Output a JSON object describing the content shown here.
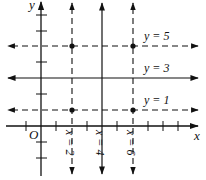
{
  "diagram": {
    "type": "coordinate-plane-lines",
    "axes": {
      "x_label": "x",
      "y_label": "y",
      "origin_label": "O"
    },
    "vertical_lines": [
      {
        "label": "x = 2",
        "value": 2,
        "style": "dashed"
      },
      {
        "label": "x = 4",
        "value": 4,
        "style": "solid"
      },
      {
        "label": "x = 6",
        "value": 6,
        "style": "dashed"
      }
    ],
    "horizontal_lines": [
      {
        "label": "y = 5",
        "value": 5,
        "style": "dashed"
      },
      {
        "label": "y = 3",
        "value": 3,
        "style": "solid"
      },
      {
        "label": "y = 1",
        "value": 1,
        "style": "dashed"
      }
    ],
    "intersection_points": [
      {
        "x": 2,
        "y": 5
      },
      {
        "x": 6,
        "y": 5
      },
      {
        "x": 2,
        "y": 1
      },
      {
        "x": 6,
        "y": 1
      }
    ],
    "colors": {
      "line": "#111111",
      "background": "#ffffff"
    }
  }
}
